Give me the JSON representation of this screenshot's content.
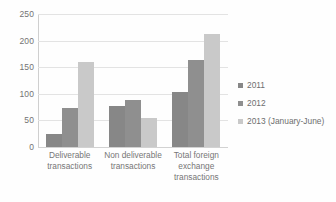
{
  "chart_data": {
    "type": "bar",
    "title": "",
    "subtitle": "",
    "xlabel": "",
    "ylabel": "",
    "ylim": [
      0,
      250
    ],
    "ytick_labels": [
      "250",
      "200",
      "150",
      "100",
      "50",
      "0"
    ],
    "ytick_values": [
      250,
      200,
      150,
      100,
      50,
      0
    ],
    "grid": true,
    "legend_position": "right",
    "categories": [
      "Deliverable transactions",
      "Non deliverable transactions",
      "Total foreign exchange transactions"
    ],
    "category_lines": [
      [
        "Deliverable",
        "transactions"
      ],
      [
        "Non deliverable",
        "transactions"
      ],
      [
        "Total foreign",
        "exchange",
        "transactions"
      ]
    ],
    "series": [
      {
        "name": "2011",
        "color": "#878787",
        "values": [
          25,
          78,
          103
        ]
      },
      {
        "name": "2012",
        "color": "#8f8f8f",
        "values": [
          73,
          88,
          164
        ]
      },
      {
        "name": "2013 (January-June)",
        "color": "#c9c9c9",
        "values": [
          159,
          54,
          212
        ]
      }
    ]
  },
  "legend": {
    "entries": [
      {
        "label": "2011",
        "color": "#878787"
      },
      {
        "label": "2012",
        "color": "#8f8f8f"
      },
      {
        "label": "2013 (January-June)",
        "color": "#c9c9c9"
      }
    ]
  },
  "colors": {
    "gridline": "#e3e3e3",
    "axis": "#cfcfcf",
    "text": "#6f6f6f",
    "background": "#ffffff"
  }
}
